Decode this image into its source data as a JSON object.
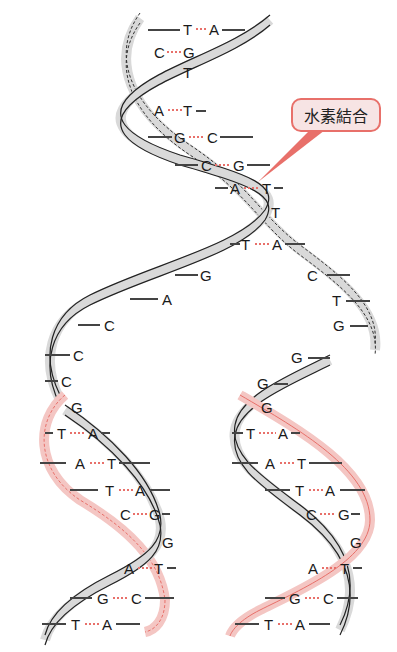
{
  "callout": {
    "label": "水素結合",
    "border_color": "#e8706a",
    "fill_color": "#f7e4e4"
  },
  "colors": {
    "parent_strand": "#d9d9d9",
    "new_strand": "#f4c6c3",
    "hbond": "#e8706a",
    "outline": "#222222"
  },
  "top_pairs": [
    {
      "left": "T",
      "right": "A"
    },
    {
      "left": "C",
      "right": "G"
    },
    {
      "left": "",
      "right": "T"
    },
    {
      "left": "A",
      "right": "T"
    },
    {
      "left": "G",
      "right": "C"
    },
    {
      "left": "C",
      "right": "G"
    },
    {
      "left": "A",
      "right": "T"
    },
    {
      "left": "",
      "right": "T"
    },
    {
      "left": "T",
      "right": "A"
    }
  ],
  "left_single": [
    "G",
    "A",
    "C",
    "C",
    "C"
  ],
  "right_single": [
    "C",
    "T",
    "G",
    "G",
    "G"
  ],
  "left_daughter_pairs": [
    {
      "left": "G",
      "right": ""
    },
    {
      "left": "T",
      "right": "A"
    },
    {
      "left": "A",
      "right": "T"
    },
    {
      "left": "T",
      "right": "A"
    },
    {
      "left": "C",
      "right": "G"
    },
    {
      "left": "",
      "right": "G"
    },
    {
      "left": "A",
      "right": "T"
    },
    {
      "left": "G",
      "right": "C"
    },
    {
      "left": "T",
      "right": "A"
    }
  ],
  "right_daughter_pairs": [
    {
      "left": "G",
      "right": ""
    },
    {
      "left": "T",
      "right": "A"
    },
    {
      "left": "A",
      "right": "T"
    },
    {
      "left": "T",
      "right": "A"
    },
    {
      "left": "C",
      "right": "G"
    },
    {
      "left": "",
      "right": "G"
    },
    {
      "left": "A",
      "right": "T"
    },
    {
      "left": "G",
      "right": "C"
    },
    {
      "left": "T",
      "right": "A"
    }
  ]
}
